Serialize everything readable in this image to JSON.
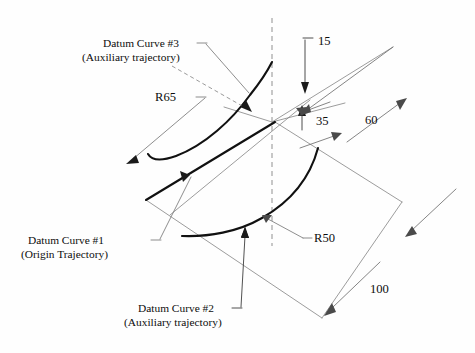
{
  "drawing": {
    "title": "Variable Section Sweep Trajectories Diagram",
    "background_color": "#fefefe",
    "width": 475,
    "height": 353,
    "curve_color": "#111111",
    "plane_color": "#8a8a8a",
    "dim_color": "#6f6f6f",
    "center_line_color": "#9a9a9a"
  },
  "annotations": {
    "datum3_line1": "Datum Curve #3",
    "datum3_line2": "(Auxiliary trajectory)",
    "datum1_line1": "Datum Curve #1",
    "datum1_line2": "(Origin Trajectory)",
    "datum2_line1": "Datum Curve #2",
    "datum2_line2": "(Auxiliary trajectory)",
    "radius_r65": "R65",
    "radius_r50": "R50"
  },
  "dimensions": {
    "height_15": "15",
    "offset_35": "35",
    "width_60": "60",
    "length_100": "100"
  },
  "geometry": {
    "plane": {
      "vertex_left": [
        146,
        200
      ],
      "vertex_top": [
        275,
        122
      ],
      "vertex_right": [
        402,
        202
      ],
      "vertex_bottom": [
        322,
        318
      ]
    },
    "center_line": {
      "x": 272,
      "y_top": 18,
      "y_bottom": 246
    },
    "curve_origin_path": "M 146 200 L 275 122",
    "curve_aux2_path": "M 182 236 Q 245 236 280 212 Q 312 190 322 148",
    "curve_aux3_path": "M 148 155 Q 160 164 178 158 Q 215 146 244 110 Q 262 88 272 70"
  }
}
